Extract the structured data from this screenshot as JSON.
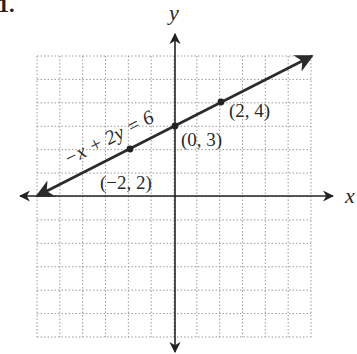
{
  "problem": {
    "number_label": "1."
  },
  "axes": {
    "x_label": "x",
    "y_label": "y",
    "x_range": [
      -6,
      6
    ],
    "y_range": [
      -6,
      6
    ],
    "grid": "dotted",
    "grid_step": 1
  },
  "line": {
    "equation_label": "−x + 2y = 6",
    "slope": 0.5,
    "y_intercept": 3,
    "color": "#2b2b2b"
  },
  "points": [
    {
      "x": -2,
      "y": 2,
      "label": "(−2, 2)"
    },
    {
      "x": 0,
      "y": 3,
      "label": "(0, 3)"
    },
    {
      "x": 2,
      "y": 4,
      "label": "(2, 4)"
    }
  ],
  "colors": {
    "axis": "#222222",
    "grid": "#9a9a9a",
    "text": "#2a2a2a"
  },
  "chart_data": {
    "type": "line",
    "title": "",
    "xlabel": "x",
    "ylabel": "y",
    "xlim": [
      -6,
      6
    ],
    "ylim": [
      -6,
      6
    ],
    "grid": true,
    "series": [
      {
        "name": "−x + 2y = 6",
        "x": [
          -6,
          6
        ],
        "y": [
          0,
          6
        ]
      }
    ],
    "annotations": [
      {
        "x": -2,
        "y": 2,
        "text": "(−2, 2)"
      },
      {
        "x": 0,
        "y": 3,
        "text": "(0, 3)"
      },
      {
        "x": 2,
        "y": 4,
        "text": "(2, 4)"
      }
    ]
  }
}
